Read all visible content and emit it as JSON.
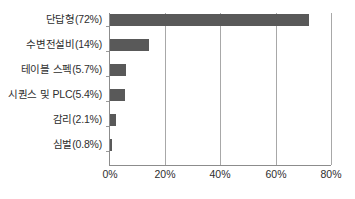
{
  "chart_data": {
    "type": "bar",
    "orientation": "horizontal",
    "title": "",
    "xlabel": "",
    "ylabel": "",
    "categories": [
      "단답형(72%)",
      "수변전설비(14%)",
      "테이블 스펙(5.7%)",
      "시퀀스 및 PLC(5.4%)",
      "감리(2.1%)",
      "심벌(0.8%)"
    ],
    "values": [
      72,
      14,
      5.7,
      5.4,
      2.1,
      0.8
    ],
    "xlim": [
      0,
      80
    ],
    "xticks": [
      0,
      20,
      40,
      60,
      80
    ],
    "xtick_labels": [
      "0%",
      "20%",
      "40%",
      "60%",
      "80%"
    ],
    "grid": true,
    "grid_axis": "x",
    "legend": false,
    "bar_color": "#595959",
    "axis_color": "#8c8c8c",
    "gridline_color": "#a8a8a8",
    "background_color": "#ffffff",
    "text_color": "#2e2e2e"
  }
}
